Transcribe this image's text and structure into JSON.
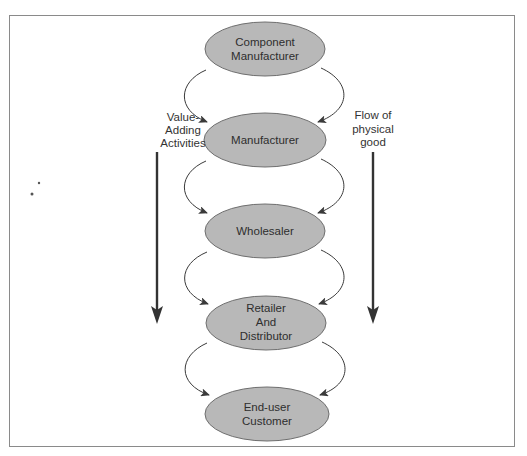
{
  "diagram": {
    "nodes": [
      {
        "id": "component-manufacturer",
        "lines": [
          "Component",
          "Manufacturer"
        ],
        "cx": 265,
        "cy": 49
      },
      {
        "id": "manufacturer",
        "lines": [
          "Manufacturer"
        ],
        "cx": 265,
        "cy": 140
      },
      {
        "id": "wholesaler",
        "lines": [
          "Wholesaler"
        ],
        "cx": 265,
        "cy": 231
      },
      {
        "id": "retailer-and-distributor",
        "lines": [
          "Retailer",
          "And",
          "Distributor"
        ],
        "cx": 266,
        "cy": 323
      },
      {
        "id": "end-user-customer",
        "lines": [
          "End-user",
          "Customer"
        ],
        "cx": 267,
        "cy": 414
      }
    ],
    "left_label": {
      "lines": [
        "Value-",
        "Adding",
        "Activities"
      ]
    },
    "right_label": {
      "lines": [
        "Flow of",
        "physical",
        "good"
      ]
    },
    "colors": {
      "node_fill": "#b8b8b8",
      "node_stroke": "#6e6e6e",
      "text": "#2e2e2e",
      "arrow": "#333333",
      "frame": "#8a8a8a"
    }
  }
}
